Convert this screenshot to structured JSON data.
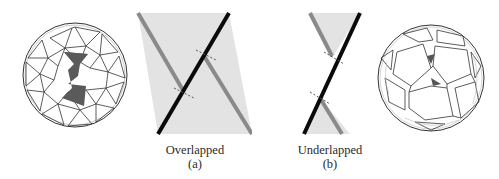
{
  "figure": {
    "panels": [
      {
        "id": "left-sphere",
        "description": "wireframe sphere of interlocking triangular tiles with dark highlighted bowtie region"
      },
      {
        "id": "a",
        "caption": "Overlapped",
        "label": "(a)"
      },
      {
        "id": "b",
        "caption": "Underlapped",
        "label": "(b)"
      },
      {
        "id": "right-sphere",
        "description": "wireframe sphere of large quadrilateral/pentagonal tiles with small dark triangular gaps"
      }
    ],
    "colors": {
      "background": "#ffffff",
      "shaded_region": "#e3e3e3",
      "black_edge": "#0a0a0a",
      "gray_edge": "#8a8a8a",
      "highlight_fill": "#5a5a5a",
      "wire": "#333333",
      "dashed_marker": "#555555"
    }
  }
}
